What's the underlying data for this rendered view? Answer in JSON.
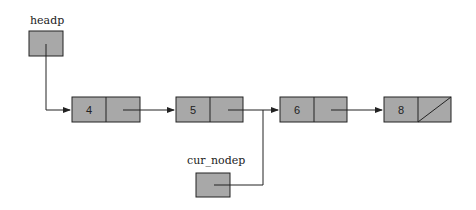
{
  "diagram": {
    "type": "linked-list",
    "colors": {
      "node_fill": "#a8a8a8",
      "stroke": "#222222",
      "background": "#ffffff"
    },
    "pointers": [
      {
        "label": "headp",
        "points_to_node": 0
      },
      {
        "label": "cur_nodep",
        "points_to_node": 2
      }
    ],
    "nodes": [
      {
        "value": "4",
        "next": 1
      },
      {
        "value": "5",
        "next": 2
      },
      {
        "value": "6",
        "next": 3
      },
      {
        "value": "8",
        "next": null
      }
    ]
  }
}
